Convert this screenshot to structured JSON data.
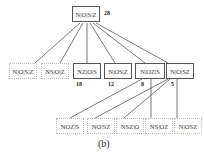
{
  "diagram": {
    "root": {
      "label": "N|O|S|Z",
      "count": "28"
    },
    "level1": [
      {
        "label": "N|O|S|Z",
        "count": "",
        "style": "dashed"
      },
      {
        "label": "NS|O|Z",
        "count": "",
        "style": "dashed"
      },
      {
        "label": "NZ|O|S",
        "count": "18",
        "style": "solid"
      },
      {
        "label": "N|OS|Z",
        "count": "12",
        "style": "solid"
      },
      {
        "label": "N|OZ|S",
        "count": "8",
        "style": "solid"
      },
      {
        "label": "N|O|SZ",
        "count": "5",
        "style": "solid"
      }
    ],
    "level2": [
      {
        "label": "NOZ|S",
        "style": "dashed"
      },
      {
        "label": "NO|SZ",
        "style": "dashed"
      },
      {
        "label": "NSZ|O",
        "style": "dashed"
      },
      {
        "label": "NS|OZ",
        "style": "dashed"
      },
      {
        "label": "N|OSZ",
        "style": "dashed"
      }
    ],
    "caption": "(b)"
  }
}
